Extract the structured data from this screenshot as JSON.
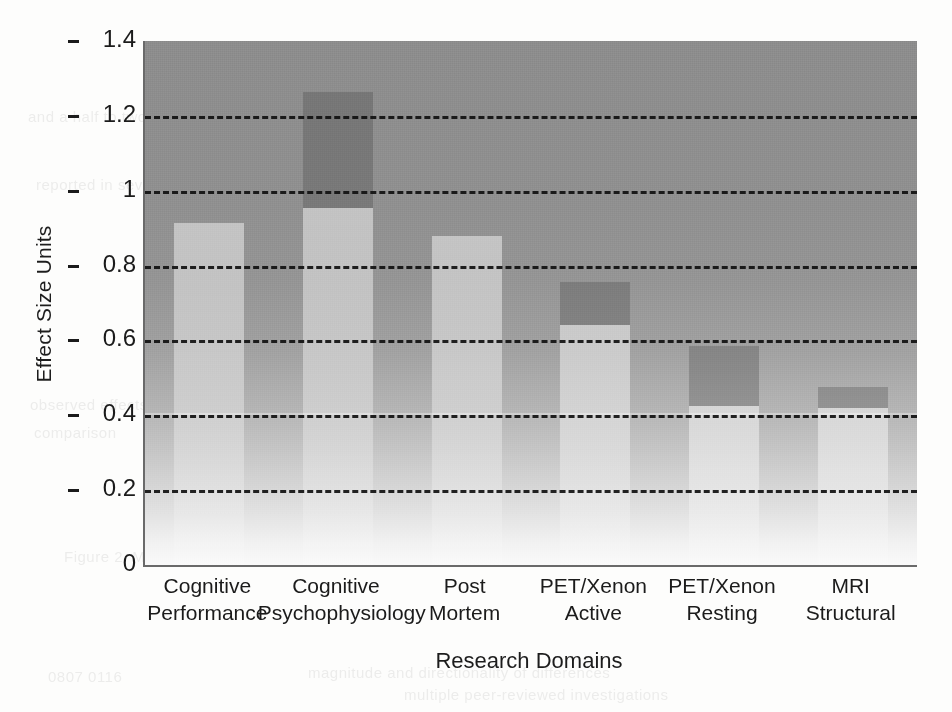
{
  "chart_data": {
    "type": "bar",
    "title": "",
    "xlabel": "Research Domains",
    "ylabel": "Effect Size Units",
    "ylim": [
      0,
      1.4
    ],
    "yticks": [
      "0",
      "0.2",
      "0.4",
      "0.6",
      "0.8",
      "1",
      "1.2",
      "1.4"
    ],
    "ytick_values": [
      0,
      0.2,
      0.4,
      0.6,
      0.8,
      1.0,
      1.2,
      1.4
    ],
    "grid": "horizontal-dashed",
    "legend": "none",
    "categories": [
      "Cognitive Performance",
      "Cognitive Psychophysiology",
      "Post Mortem",
      "PET/Xenon Active",
      "PET/Xenon Resting",
      "MRI Structural"
    ],
    "category_lines": [
      [
        "Cognitive",
        "Performance"
      ],
      [
        "Cognitive",
        "Psychophysiology"
      ],
      [
        "Post",
        "Mortem"
      ],
      [
        "PET/Xenon",
        "Active"
      ],
      [
        "PET/Xenon",
        "Resting"
      ],
      [
        "MRI",
        "Structural"
      ]
    ],
    "series": [
      {
        "name": "Effect size (light segment)",
        "values": [
          0.915,
          0.955,
          0.88,
          0.64,
          0.425,
          0.42
        ]
      },
      {
        "name": "Upper range (dark cap top)",
        "values": [
          0.915,
          1.265,
          0.88,
          0.755,
          0.585,
          0.475
        ]
      }
    ],
    "values": [
      0.915,
      1.265,
      0.88,
      0.755,
      0.585,
      0.475
    ],
    "colors": {
      "plot_background_top": "#8d8d8d",
      "plot_background_bottom": "#fafafa",
      "bar_light": "#c9c9c9",
      "bar_dark": "#7d7d7d",
      "gridline": "#111111",
      "axis": "#6a6a6a",
      "text": "#1b1b1b"
    }
  },
  "background_bleed": [
    {
      "text": "and a half to two times",
      "x": 28,
      "y": 108
    },
    {
      "text": "the same period, with",
      "x": 612,
      "y": 92
    },
    {
      "text": "more pronounced in",
      "x": 700,
      "y": 128
    },
    {
      "text": "reported in several",
      "x": 36,
      "y": 176
    },
    {
      "text": "observed effects",
      "x": 30,
      "y": 396
    },
    {
      "text": "comparison",
      "x": 34,
      "y": 424
    },
    {
      "text": "Figure 2. Mean weighted effect sizes across six research domains.",
      "x": 64,
      "y": 548
    },
    {
      "text": "0807  0116",
      "x": 48,
      "y": 668
    },
    {
      "text": "magnitude and directionality of differences",
      "x": 308,
      "y": 664
    },
    {
      "text": "multiple peer-reviewed investigations",
      "x": 404,
      "y": 686
    }
  ]
}
